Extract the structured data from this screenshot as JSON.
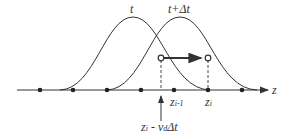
{
  "diagram": {
    "labels": {
      "curve_t": "t",
      "curve_t_dt": "t+Δt",
      "axis": "z",
      "z_im1_main": "z",
      "z_im1_sub": "i-1",
      "z_i_main": "z",
      "z_i_sub": "i",
      "back_main": "z",
      "back_sub1": "i",
      "back_mid": " - v",
      "back_sub2": "d",
      "back_tail": "Δt"
    },
    "grid_points": 7,
    "colors": {
      "line": "#333333",
      "background": "#ffffff"
    }
  }
}
